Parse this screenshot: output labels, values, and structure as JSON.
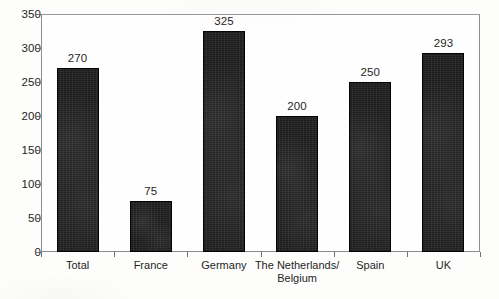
{
  "chart_data": {
    "type": "bar",
    "title": "",
    "subtitle": "",
    "xlabel": "",
    "ylabel": "",
    "ylim": [
      0,
      350
    ],
    "ytick_step": 50,
    "yticks": [
      "0",
      "50",
      "100",
      "150",
      "200",
      "250",
      "300",
      "350"
    ],
    "grid": false,
    "legend": false,
    "legend_position": "none",
    "bar_color": "#1b1b1b",
    "frame_color": "#8d8d8d",
    "background_color": "#fdfdfc",
    "data_labels_shown": true,
    "categories": [
      "Total",
      "France",
      "Germany",
      "The Netherlands/ Belgium",
      "Spain",
      "UK"
    ],
    "category_label_lines": [
      [
        "Total"
      ],
      [
        "France"
      ],
      [
        "Germany"
      ],
      [
        "The Netherlands/",
        "Belgium"
      ],
      [
        "Spain"
      ],
      [
        "UK"
      ]
    ],
    "values": [
      270,
      75,
      325,
      200,
      250,
      293
    ],
    "value_labels": [
      "270",
      "75",
      "325",
      "200",
      "250",
      "293"
    ]
  }
}
